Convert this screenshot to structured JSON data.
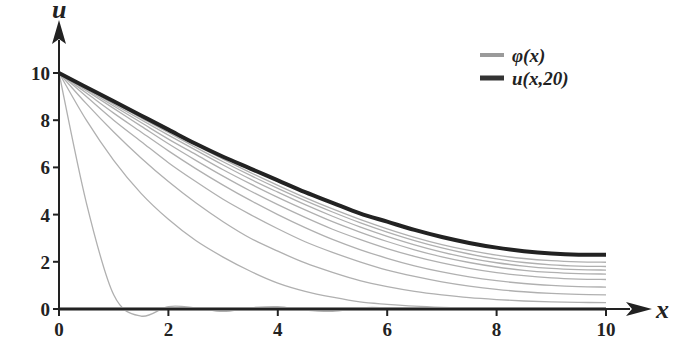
{
  "chart_data": {
    "type": "line",
    "title": "",
    "xlabel": "x",
    "ylabel": "u",
    "xlim": [
      0,
      10
    ],
    "ylim": [
      0,
      10
    ],
    "x_ticks": [
      "0",
      "2",
      "4",
      "6",
      "8",
      "10"
    ],
    "y_ticks": [
      "0",
      "2",
      "4",
      "6",
      "8",
      "10"
    ],
    "grid": false,
    "legend_position": "upper right",
    "legend": [
      {
        "label": "φ(x)",
        "color": "#9a9a9a",
        "width": 4
      },
      {
        "label": "u(x,20)",
        "color": "#333333",
        "width": 5
      }
    ],
    "x": [
      0,
      0.5,
      1,
      1.5,
      2,
      2.5,
      3,
      3.5,
      4,
      4.5,
      5,
      5.5,
      6,
      6.5,
      7,
      7.5,
      8,
      8.5,
      9,
      9.5,
      10
    ],
    "series": [
      {
        "name": "φ(x)",
        "role": "initial",
        "color": "#8c8c8c",
        "width": 4,
        "values": [
          0,
          0,
          0,
          0,
          0,
          0,
          0,
          0,
          0,
          0,
          0,
          0,
          0,
          0,
          0,
          0,
          0,
          0,
          0,
          0,
          0
        ]
      },
      {
        "name": "u(x,1)",
        "role": "intermediate",
        "color": "#b0b0b0",
        "width": 1.3,
        "values": [
          10,
          4.5,
          0.6,
          -0.3,
          0.1,
          0.05,
          -0.1,
          0.05,
          0.1,
          -0.05,
          -0.1,
          0.05,
          0.05,
          -0.05,
          0,
          0.05,
          -0.05,
          0,
          0.05,
          0,
          0
        ]
      },
      {
        "name": "u(x,2)",
        "role": "intermediate",
        "color": "#b0b0b0",
        "width": 1.3,
        "values": [
          10,
          8.0,
          6.3,
          4.9,
          3.8,
          2.9,
          2.2,
          1.6,
          1.1,
          0.75,
          0.5,
          0.3,
          0.2,
          0.12,
          0.07,
          0.04,
          0.02,
          0.01,
          0,
          0,
          0
        ]
      },
      {
        "name": "u(x,4)",
        "role": "intermediate",
        "color": "#b0b0b0",
        "width": 1.3,
        "values": [
          10,
          8.7,
          7.5,
          6.4,
          5.4,
          4.5,
          3.7,
          3.0,
          2.45,
          1.95,
          1.55,
          1.2,
          0.95,
          0.75,
          0.6,
          0.48,
          0.4,
          0.34,
          0.3,
          0.28,
          0.27
        ]
      },
      {
        "name": "u(x,6)",
        "role": "intermediate",
        "color": "#b0b0b0",
        "width": 1.3,
        "values": [
          10,
          9.0,
          8.0,
          7.1,
          6.2,
          5.4,
          4.65,
          4.0,
          3.4,
          2.85,
          2.4,
          2.0,
          1.65,
          1.38,
          1.15,
          0.97,
          0.83,
          0.73,
          0.66,
          0.62,
          0.6
        ]
      },
      {
        "name": "u(x,8)",
        "role": "intermediate",
        "color": "#b0b0b0",
        "width": 1.3,
        "values": [
          10,
          9.15,
          8.3,
          7.5,
          6.7,
          5.95,
          5.25,
          4.6,
          4.0,
          3.45,
          2.95,
          2.52,
          2.15,
          1.83,
          1.57,
          1.36,
          1.2,
          1.08,
          1.0,
          0.95,
          0.93
        ]
      },
      {
        "name": "u(x,10)",
        "role": "intermediate",
        "color": "#b0b0b0",
        "width": 1.3,
        "values": [
          10,
          9.25,
          8.5,
          7.75,
          7.0,
          6.3,
          5.63,
          5.0,
          4.42,
          3.88,
          3.38,
          2.95,
          2.56,
          2.23,
          1.95,
          1.72,
          1.54,
          1.41,
          1.32,
          1.27,
          1.25
        ]
      },
      {
        "name": "u(x,12)",
        "role": "intermediate",
        "color": "#b0b0b0",
        "width": 1.3,
        "values": [
          10,
          9.3,
          8.6,
          7.9,
          7.2,
          6.55,
          5.9,
          5.3,
          4.73,
          4.2,
          3.7,
          3.26,
          2.86,
          2.51,
          2.21,
          1.97,
          1.78,
          1.64,
          1.55,
          1.5,
          1.48
        ]
      },
      {
        "name": "u(x,14)",
        "role": "intermediate",
        "color": "#b0b0b0",
        "width": 1.3,
        "values": [
          10,
          9.35,
          8.68,
          8.02,
          7.37,
          6.73,
          6.1,
          5.5,
          4.95,
          4.42,
          3.93,
          3.48,
          3.08,
          2.72,
          2.41,
          2.16,
          1.96,
          1.82,
          1.72,
          1.67,
          1.65
        ]
      },
      {
        "name": "u(x,16)",
        "role": "intermediate",
        "color": "#b0b0b0",
        "width": 1.3,
        "values": [
          10,
          9.38,
          8.75,
          8.1,
          7.48,
          6.85,
          6.24,
          5.66,
          5.11,
          4.59,
          4.11,
          3.66,
          3.26,
          2.9,
          2.59,
          2.33,
          2.12,
          1.97,
          1.87,
          1.82,
          1.8
        ]
      },
      {
        "name": "u(x,18)",
        "role": "intermediate",
        "color": "#b0b0b0",
        "width": 1.3,
        "values": [
          10,
          9.4,
          8.78,
          8.16,
          7.55,
          6.94,
          6.35,
          5.78,
          5.24,
          4.72,
          4.24,
          3.8,
          3.4,
          3.04,
          2.73,
          2.48,
          2.28,
          2.14,
          2.05,
          2.0,
          1.98
        ]
      },
      {
        "name": "u(x,20)",
        "role": "final",
        "color": "#222222",
        "width": 4,
        "values": [
          10,
          9.4,
          8.8,
          8.2,
          7.6,
          7.0,
          6.45,
          5.95,
          5.45,
          4.95,
          4.5,
          4.05,
          3.7,
          3.35,
          3.05,
          2.8,
          2.6,
          2.45,
          2.35,
          2.3,
          2.3
        ]
      }
    ]
  }
}
